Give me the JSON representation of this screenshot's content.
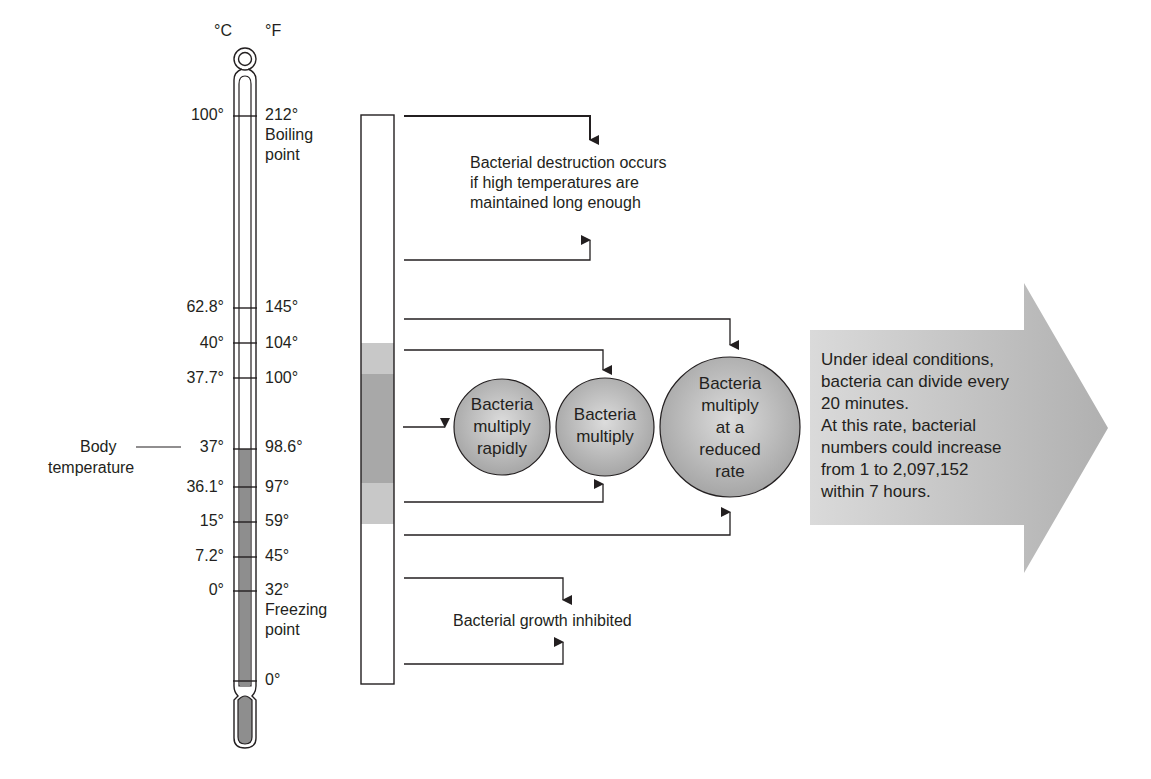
{
  "thermometer": {
    "unit_c": "°C",
    "unit_f": "°F",
    "marks": [
      {
        "c": "100°",
        "f": "212°",
        "note": "Boiling point"
      },
      {
        "c": "62.8°",
        "f": "145°"
      },
      {
        "c": "40°",
        "f": "104°"
      },
      {
        "c": "37.7°",
        "f": "100°"
      },
      {
        "c": "37°",
        "f": "98.6°"
      },
      {
        "c": "36.1°",
        "f": "97°"
      },
      {
        "c": "15°",
        "f": "59°"
      },
      {
        "c": "7.2°",
        "f": "45°"
      },
      {
        "c": "0°",
        "f": "32°",
        "note": "Freezing point"
      },
      {
        "c": "",
        "f": "0°"
      }
    ],
    "boiling_line1": "Boiling",
    "boiling_line2": "point",
    "freezing_line1": "Freezing",
    "freezing_line2": "point",
    "body_temp_line1": "Body",
    "body_temp_line2": "temperature"
  },
  "zones": {
    "destruction": {
      "line1": "Bacterial destruction occurs",
      "line2": "if high temperatures are",
      "line3": "maintained long enough"
    },
    "circles": [
      {
        "lines": [
          "Bacteria",
          "multiply",
          "rapidly"
        ]
      },
      {
        "lines": [
          "Bacteria",
          "multiply"
        ]
      },
      {
        "lines": [
          "Bacteria",
          "multiply",
          "at a",
          "reduced",
          "rate"
        ]
      }
    ],
    "inhibited": "Bacterial growth inhibited"
  },
  "big_arrow": {
    "lines": [
      "Under ideal conditions,",
      "bacteria can divide every",
      "20 minutes.",
      "At this rate, bacterial",
      "numbers could increase",
      "from 1 to 2,097,152",
      "within 7 hours."
    ]
  },
  "colors": {
    "line": "#231f20",
    "mercury": "#8e8e8e",
    "zone_light": "#c8c8c8",
    "zone_dark": "#a8a8a8",
    "circle_fill": "#b4b4b4",
    "arrow_fill": "#c2c2c2"
  }
}
